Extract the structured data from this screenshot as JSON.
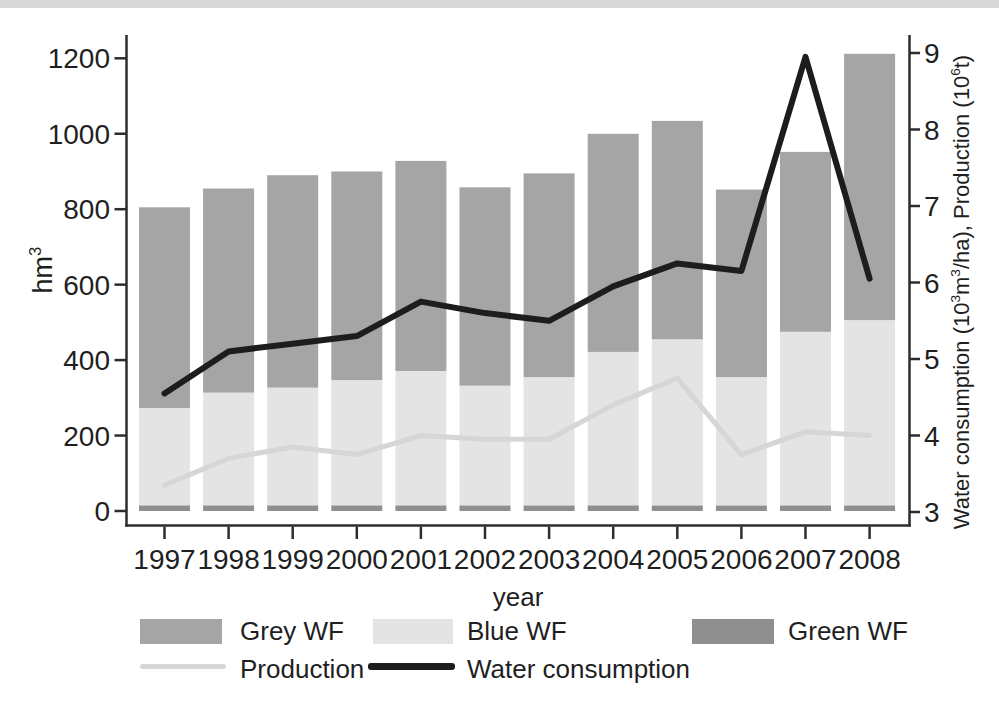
{
  "figure": {
    "left_axis_title": {
      "text": "hm",
      "sup": "3"
    },
    "x_axis_title": "year",
    "right_axis_title": {
      "p1": "Water consumption (10",
      "s1": "3",
      "p2": "m",
      "s2": "3",
      "p3": "/ha), Production (10",
      "s3": "6",
      "p4": "t)"
    }
  },
  "legend": {
    "row1": [
      {
        "label": "Grey WF",
        "swatch": "box",
        "color_key": "grey_wf"
      },
      {
        "label": "Blue WF",
        "swatch": "box",
        "color_key": "blue_wf"
      },
      {
        "label": "Green WF",
        "swatch": "box",
        "color_key": "green_wf"
      }
    ],
    "row2": [
      {
        "label": "Production",
        "swatch": "line",
        "color_key": "production"
      },
      {
        "label": "Water consumption",
        "swatch": "line",
        "color_key": "water"
      }
    ]
  },
  "chart_data": {
    "type": "combo-stacked-bar-line",
    "categories": [
      "1997",
      "1998",
      "1999",
      "2000",
      "2001",
      "2002",
      "2003",
      "2004",
      "2005",
      "2006",
      "2007",
      "2008"
    ],
    "series": [
      {
        "name": "Green WF",
        "type": "bar",
        "axis": "left",
        "stack_order": 0,
        "color_key": "green_wf",
        "values": [
          15,
          15,
          15,
          15,
          15,
          15,
          15,
          15,
          15,
          15,
          15,
          15
        ]
      },
      {
        "name": "Blue WF",
        "type": "bar",
        "axis": "left",
        "stack_order": 1,
        "color_key": "blue_wf",
        "values": [
          258,
          299,
          312,
          332,
          356,
          317,
          340,
          407,
          440,
          340,
          460,
          491
        ]
      },
      {
        "name": "Grey WF",
        "type": "bar",
        "axis": "left",
        "stack_order": 2,
        "color_key": "grey_wf",
        "values": [
          532,
          541,
          563,
          553,
          557,
          526,
          540,
          578,
          579,
          497,
          477,
          706
        ]
      },
      {
        "name": "Production",
        "type": "line",
        "axis": "right",
        "color_key": "production",
        "values": [
          3.35,
          3.7,
          3.85,
          3.75,
          4.0,
          3.95,
          3.95,
          4.4,
          4.75,
          3.75,
          4.05,
          4.0
        ]
      },
      {
        "name": "Water consumption",
        "type": "line",
        "axis": "right",
        "color_key": "water",
        "values": [
          4.55,
          5.1,
          5.2,
          5.3,
          5.75,
          5.6,
          5.5,
          5.95,
          6.25,
          6.15,
          8.95,
          6.05
        ]
      }
    ],
    "bar_totals": [
      805,
      855,
      890,
      900,
      928,
      858,
      895,
      1000,
      1034,
      852,
      952,
      1212
    ],
    "left_axis": {
      "title": "hm³",
      "ticks": [
        0,
        200,
        400,
        600,
        800,
        1000,
        1200
      ],
      "range": [
        0,
        1200
      ]
    },
    "right_axis": {
      "title": "Water consumption (10³m³/ha), Production (10⁶t)",
      "ticks": [
        3,
        4,
        5,
        6,
        7,
        8,
        9
      ],
      "range": [
        3,
        9
      ]
    },
    "grid": false,
    "legend_position": "bottom",
    "colors": {
      "grey_wf": "#a5a5a5",
      "blue_wf": "#e4e4e4",
      "green_wf": "#8f8f8f",
      "production": "#d6d6d6",
      "water": "#1d1d1d",
      "axis": "#2d2d2d",
      "text": "#1f1f1f"
    }
  }
}
